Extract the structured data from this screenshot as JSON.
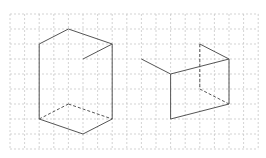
{
  "figure": {
    "grid": {
      "origin_x": 10,
      "origin_y": 14,
      "cell_w": 14.6,
      "cell_h": 15,
      "cols": 17,
      "rows": 9,
      "color": "#c8c8c8"
    },
    "line_color": "#555555",
    "shapes": [
      {
        "name": "left-prism",
        "solid": [
          [
            2,
            2,
            4,
            1
          ],
          [
            4,
            1,
            7,
            2
          ],
          [
            7,
            2,
            5,
            3
          ],
          [
            2,
            2,
            2,
            7
          ],
          [
            7,
            2,
            7,
            7
          ],
          [
            2,
            7,
            5,
            8
          ],
          [
            5,
            8,
            7,
            7
          ]
        ],
        "dashed": [
          [
            2,
            7,
            4,
            6
          ],
          [
            4,
            6,
            7,
            7
          ]
        ]
      },
      {
        "name": "right-figure",
        "solid": [
          [
            9,
            3,
            11,
            4
          ],
          [
            11,
            4,
            15,
            3
          ],
          [
            13,
            2,
            15,
            3
          ],
          [
            15,
            3,
            15,
            6
          ],
          [
            11,
            4,
            11,
            7
          ],
          [
            11,
            7,
            15,
            6
          ]
        ],
        "dashed": [
          [
            13,
            2,
            13,
            5
          ],
          [
            13,
            5,
            15,
            6
          ]
        ]
      }
    ]
  }
}
